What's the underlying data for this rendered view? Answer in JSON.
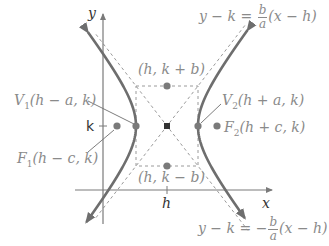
{
  "diagram": {
    "colors": {
      "curve": "#6e6e6e",
      "axis": "#7a7a7a",
      "dashed": "#9a9a9a",
      "point": "#7a7a7a",
      "center": "#333333",
      "label": "#8a8a8a",
      "axis_label": "#333333"
    },
    "axes": {
      "x_label": "x",
      "y_label": "y",
      "h_tick_label": "h",
      "k_tick_label": "k"
    },
    "points": {
      "center": "(h, k)",
      "co_vertex_top": "(h, k + b)",
      "co_vertex_bottom": "(h, k − b)",
      "vertex_left": {
        "name": "V",
        "sub": "1",
        "coords": "(h − a, k)"
      },
      "vertex_right": {
        "name": "V",
        "sub": "2",
        "coords": "(h + a, k)"
      },
      "focus_left": {
        "name": "F",
        "sub": "1",
        "coords": "(h − c, k)"
      },
      "focus_right": {
        "name": "F",
        "sub": "2",
        "coords": "(h + c, k)"
      }
    },
    "asymptotes": {
      "upper": {
        "lhs": "y − k =",
        "sign": "",
        "num": "b",
        "den": "a",
        "rhs": "(x − h)"
      },
      "lower": {
        "lhs": "y − k =",
        "sign": "−",
        "num": "b",
        "den": "a",
        "rhs": "(x − h)"
      }
    }
  }
}
